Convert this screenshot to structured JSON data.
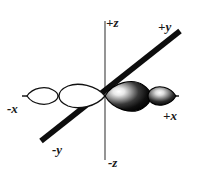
{
  "figure": {
    "background_color": "#ffffff",
    "width": 198,
    "height": 182
  },
  "axes": {
    "z": {
      "name": "z-axis",
      "orientation": "vertical",
      "color": "#7a7a7a",
      "stroke_width": 1.6,
      "positive_label": "+z",
      "negative_label": "-z",
      "x1": 105,
      "y1": 21,
      "x2": 105,
      "y2": 160
    },
    "y": {
      "name": "y-axis",
      "orientation": "diagonal",
      "color": "#0d0d0d",
      "stroke_width": 5.5,
      "positive_label": "+y",
      "negative_label": "-y",
      "x1": 41,
      "y1": 141,
      "x2": 180,
      "y2": 31
    },
    "x": {
      "name": "x-axis",
      "orientation": "horizontal",
      "color": "#1a1a1a",
      "stroke_width": 1.3,
      "positive_label": "+x",
      "negative_label": "-x",
      "x1": 22,
      "y1": 96,
      "x2": 179,
      "y2": 96
    }
  },
  "orbital": {
    "name": "orbital-lobes",
    "origin": {
      "x": 105,
      "y": 96
    },
    "lobes": [
      {
        "id": "inner-negative-x",
        "side": "negative-x",
        "fill": "none",
        "outline_color": "#111111",
        "phase": "positive-phase-unfilled",
        "tip_x": 105,
        "tip_y": 96,
        "far_x": 60,
        "far_y": 96,
        "half_height": 13
      },
      {
        "id": "outer-negative-x",
        "side": "negative-x",
        "fill": "none",
        "outline_color": "#111111",
        "phase": "positive-phase-unfilled",
        "tip_x": 27,
        "tip_y": 96,
        "far_x": 58,
        "far_y": 96,
        "half_height": 9
      },
      {
        "id": "inner-positive-x",
        "side": "positive-x",
        "fill": "#0a0a0a",
        "highlight": "#f2f2f2",
        "phase": "negative-phase-filled",
        "tip_x": 105,
        "tip_y": 96,
        "far_x": 150,
        "far_y": 96,
        "half_height": 15
      },
      {
        "id": "outer-positive-x",
        "side": "positive-x",
        "fill": "#0a0a0a",
        "highlight": "#efefef",
        "phase": "negative-phase-filled",
        "tip_x": 176,
        "tip_y": 96,
        "far_x": 148,
        "far_y": 96,
        "half_height": 10
      }
    ]
  }
}
